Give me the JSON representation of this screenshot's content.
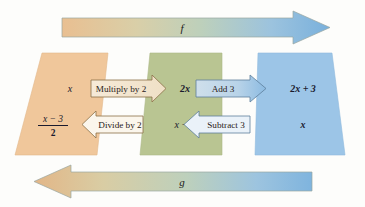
{
  "figure": {
    "top_arrow": {
      "label": "f",
      "direction": "right",
      "gradient_from": "#e8bd8f",
      "gradient_to": "#7eb4dd"
    },
    "bottom_arrow": {
      "label": "g",
      "direction": "left",
      "gradient_from": "#e8bd8f",
      "gradient_to": "#7eb4dd"
    },
    "sets": [
      {
        "name": "domain-set",
        "color": "#f0c89c",
        "top_value": "x",
        "bottom_value_numerator": "x − 3",
        "bottom_value_denominator": "2"
      },
      {
        "name": "intermediate-set",
        "color": "#b8c591",
        "top_value": "2x",
        "bottom_value": "x − 3"
      },
      {
        "name": "range-set",
        "color": "#9bc4e6",
        "top_value": "2x + 3",
        "bottom_value": "x"
      }
    ],
    "operations": [
      {
        "name": "multiply-by-2",
        "label": "Multiply by 2",
        "direction": "right",
        "fill": "#f3e3ce",
        "stroke": "#8a7046"
      },
      {
        "name": "add-3",
        "label": "Add 3",
        "direction": "right",
        "fill": "#d7e4ee",
        "stroke": "#5d7f9c"
      },
      {
        "name": "divide-by-2",
        "label": "Divide by 2",
        "direction": "left",
        "fill": "#fbf6ec",
        "stroke": "#8a7046"
      },
      {
        "name": "subtract-3",
        "label": "Subtract 3",
        "direction": "left",
        "fill": "#eaf2f9",
        "stroke": "#5d7f9c"
      }
    ]
  }
}
